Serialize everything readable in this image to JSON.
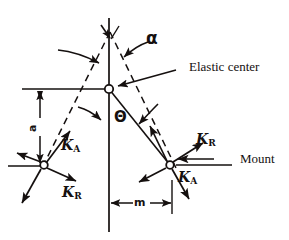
{
  "figure": {
    "kind": "engineering-schematic",
    "background_color": "#ffffff",
    "ink_color": "#15100f"
  },
  "labels": {
    "elastic_center": "Elastic center",
    "mount": "Mount",
    "alpha": "α",
    "theta": "Θ",
    "dim_a": "a",
    "dim_m": "m",
    "k_letter": "K",
    "k_axial_sub": "A",
    "k_radial_sub": "R"
  },
  "stiffness_labels": {
    "left_axial": {
      "letter": "K",
      "sub": "A"
    },
    "left_radial": {
      "letter": "K",
      "sub": "R"
    },
    "right_axial": {
      "letter": "K",
      "sub": "A"
    },
    "right_radial": {
      "letter": "K",
      "sub": "R"
    }
  },
  "nodes": {
    "elastic_center": {
      "x": 109,
      "y": 89
    },
    "apex": {
      "x": 110,
      "y": 40
    },
    "left_mount": {
      "x": 44,
      "y": 165
    },
    "right_mount": {
      "x": 170,
      "y": 165
    }
  },
  "geometry": {
    "vertical_axis": {
      "x": 109,
      "y_top": 18,
      "y_bottom": 232
    },
    "horizontal_reference": {
      "x_left": 22,
      "x_right": 109,
      "y": 89
    },
    "mount_baseline_left": {
      "x_left": 8,
      "x_right": 48,
      "y": 166
    },
    "mount_baseline_right": {
      "x_left": 176,
      "x_right": 232,
      "y": 165
    },
    "dim_m_span": {
      "x_left": 110,
      "x_right": 172,
      "y": 203
    },
    "dim_a_span": {
      "x": 40,
      "y_top": 90,
      "y_bottom": 163
    }
  },
  "annotations": {
    "alpha_leader_from": {
      "x": 148,
      "y": 42
    },
    "alpha_leader_to": {
      "x": 123,
      "y": 57
    },
    "elastic_center_leader_from": {
      "x": 175,
      "y": 70
    },
    "elastic_center_leader_to": {
      "x": 118,
      "y": 86
    },
    "theta_leader_from": {
      "x": 82,
      "y": 110
    },
    "theta_leader_to": {
      "x": 104,
      "y": 120
    }
  }
}
